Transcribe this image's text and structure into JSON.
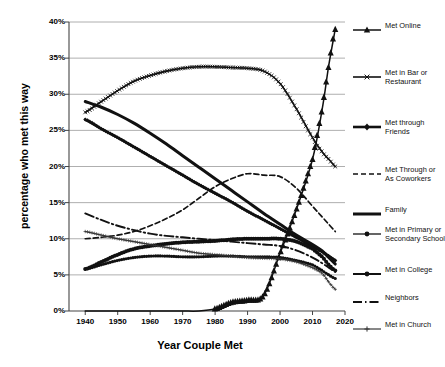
{
  "chart_data": {
    "type": "line",
    "title": "",
    "xlabel": "Year Couple Met",
    "ylabel": "percentage who met this way",
    "xlim": [
      1935,
      2020
    ],
    "ylim": [
      0,
      40
    ],
    "grid": true,
    "legend_position": "right",
    "xticks": [
      "1940",
      "1950",
      "1960",
      "1970",
      "1980",
      "1990",
      "2000",
      "2010",
      "2020"
    ],
    "yticks": [
      "0%",
      "5%",
      "10%",
      "15%",
      "20%",
      "25%",
      "30%",
      "35%",
      "40%"
    ],
    "x": [
      1940,
      1945,
      1950,
      1955,
      1960,
      1965,
      1970,
      1975,
      1980,
      1985,
      1990,
      1995,
      2000,
      2005,
      2010,
      2013,
      2015,
      2017
    ],
    "series": [
      {
        "name": "Met Online",
        "key": "met-online",
        "marker": "triangle",
        "style": "solid",
        "values": [
          0,
          0,
          0,
          0,
          0,
          0,
          0,
          0,
          0.3,
          1.2,
          1.5,
          2.2,
          8,
          14,
          21,
          28,
          34,
          39
        ]
      },
      {
        "name": "Met in Bar or Restaurant",
        "key": "met-in-bar-or-restaurant",
        "marker": "small-x",
        "style": "solid",
        "values": [
          27.5,
          29,
          30.5,
          31.8,
          32.6,
          33.2,
          33.6,
          33.8,
          33.8,
          33.7,
          33.6,
          33.2,
          31.5,
          28,
          24,
          22,
          21,
          20
        ]
      },
      {
        "name": "Met through Friends",
        "key": "met-through-friends",
        "marker": "diamond",
        "style": "solid",
        "values": [
          26.5,
          25.2,
          24,
          22.7,
          21.4,
          20.1,
          18.8,
          17.5,
          16.3,
          15.1,
          13.8,
          12.6,
          11.4,
          10.2,
          9,
          8.2,
          7.6,
          7
        ]
      },
      {
        "name": "Met Through or As Coworkers",
        "key": "met-through-or-as-coworkers",
        "marker": "none",
        "style": "dashed",
        "values": [
          10,
          10.2,
          10.5,
          11,
          11.8,
          12.8,
          14,
          15.6,
          17.2,
          18.3,
          19,
          18.8,
          18.6,
          17,
          14.5,
          13,
          12,
          11
        ]
      },
      {
        "name": "Family",
        "key": "family",
        "marker": "none",
        "style": "thick-solid",
        "values": [
          29,
          28.2,
          27.2,
          26,
          24.6,
          23.1,
          21.5,
          19.9,
          18.3,
          16.7,
          15.1,
          13.5,
          12,
          10.5,
          9.2,
          8.3,
          7.4,
          6.5
        ]
      },
      {
        "name": "Met in Primary or Secondary School",
        "key": "met-in-primary-or-secondary-school",
        "marker": "filled-dot",
        "style": "solid",
        "values": [
          5.8,
          6.4,
          7,
          7.4,
          7.6,
          7.6,
          7.5,
          7.5,
          7.6,
          7.6,
          7.5,
          7.5,
          7.4,
          7,
          6.4,
          5.6,
          5,
          4.5
        ]
      },
      {
        "name": "Met in College",
        "key": "met-in-college",
        "marker": "filled-dot",
        "style": "solid",
        "values": [
          5.8,
          6.8,
          7.8,
          8.6,
          9,
          9.3,
          9.5,
          9.6,
          9.7,
          9.9,
          10,
          10,
          10,
          9.6,
          8.6,
          7.5,
          6.4,
          5.6
        ]
      },
      {
        "name": "Neighbors",
        "key": "neighbors",
        "marker": "none",
        "style": "dash-dot",
        "values": [
          13.5,
          12.6,
          11.8,
          11.2,
          10.7,
          10.4,
          10.2,
          10,
          9.8,
          9.6,
          9.4,
          9.2,
          9,
          8.4,
          7.4,
          6.6,
          6,
          5.4
        ]
      },
      {
        "name": "Met in Church",
        "key": "met-in-church",
        "marker": "plus",
        "style": "thin-solid",
        "values": [
          11,
          10.5,
          10,
          9.6,
          9.2,
          8.8,
          8.4,
          8,
          7.8,
          7.6,
          7.4,
          7.3,
          7.2,
          6.8,
          6,
          5.2,
          4,
          3
        ]
      }
    ]
  },
  "legend": {
    "items": [
      {
        "label": "Met Online",
        "key": "met-online"
      },
      {
        "label": "Met in Bar or Restaurant",
        "key": "met-in-bar-or-restaurant"
      },
      {
        "label": "Met through Friends",
        "key": "met-through-friends"
      },
      {
        "label": "Met Through or As Coworkers",
        "key": "met-through-or-as-coworkers"
      },
      {
        "label": "Family",
        "key": "family"
      },
      {
        "label": "Met in Primary or Secondary School",
        "key": "met-in-primary-or-secondary-school"
      },
      {
        "label": "Met in College",
        "key": "met-in-college"
      },
      {
        "label": "Neighbors",
        "key": "neighbors"
      },
      {
        "label": "Met in Church",
        "key": "met-in-church"
      }
    ]
  },
  "colors": {
    "line": "#111111",
    "grid": "#9a9a9a",
    "axis": "#555555",
    "background": "#ffffff"
  }
}
